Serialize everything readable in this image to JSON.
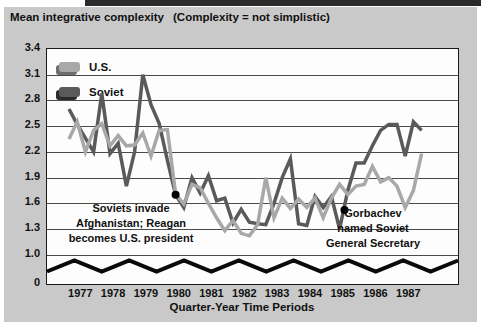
{
  "figure": {
    "title": "Mean integrative complexity",
    "subtitle": "(Complexity = not simplistic)"
  },
  "legend": [
    {
      "label": "U.S.",
      "color": "#a8a8a8",
      "shadow": "#6e6e6e"
    },
    {
      "label": "Soviet",
      "color": "#5a5a5a",
      "shadow": "#2a2a2a"
    }
  ],
  "events": [
    {
      "lines": [
        "Soviets invade",
        "Afghanistan; Reagan",
        "becomes U.S. president"
      ],
      "marker": {
        "series": "Soviet",
        "period": "1980 Q2",
        "value": 1.7,
        "index": 13
      }
    },
    {
      "lines": [
        "Gorbachev",
        "named Soviet",
        "General Secretary"
      ],
      "marker": {
        "series": "Soviet",
        "period": "1985 Q2-Q3",
        "value": 1.52,
        "index": 33.6
      }
    }
  ],
  "chart_data": {
    "type": "line",
    "title": "Mean integrative complexity",
    "xlabel": "Quarter-Year Time Periods",
    "ylabel": "Mean integrative complexity",
    "x_years": [
      "1977",
      "1978",
      "1979",
      "1980",
      "1981",
      "1982",
      "1983",
      "1984",
      "1985",
      "1986",
      "1987"
    ],
    "points_per_year": 4,
    "yticks": [
      "3.4",
      "3.1",
      "2.8",
      "2.5",
      "2.2",
      "1.9",
      "1.6",
      "1.3",
      "1.0",
      "0"
    ],
    "ylim_displayed": [
      1.0,
      3.4
    ],
    "axis_break_above_zero": true,
    "grid": "horizontal",
    "legend_position": "top-left-inside",
    "series": [
      {
        "name": "U.S.",
        "color": "#a8a8a8",
        "values": [
          2.35,
          2.55,
          2.2,
          2.45,
          2.53,
          2.27,
          2.39,
          2.27,
          2.28,
          2.42,
          2.15,
          2.45,
          2.46,
          1.71,
          1.59,
          1.82,
          1.78,
          1.6,
          1.43,
          1.28,
          1.4,
          1.25,
          1.22,
          1.35,
          1.9,
          1.43,
          1.66,
          1.54,
          1.65,
          1.55,
          1.66,
          1.43,
          1.66,
          1.82,
          1.7,
          1.8,
          1.82,
          2.03,
          1.85,
          1.9,
          1.8,
          1.55,
          1.75,
          2.18
        ]
      },
      {
        "name": "Soviet",
        "color": "#5a5a5a",
        "values": [
          2.7,
          2.52,
          2.36,
          2.2,
          2.88,
          2.18,
          2.3,
          1.8,
          2.2,
          3.1,
          2.75,
          2.53,
          2.1,
          1.7,
          1.55,
          1.9,
          1.72,
          1.92,
          1.63,
          1.66,
          1.37,
          1.53,
          1.38,
          1.36,
          1.35,
          1.6,
          1.9,
          2.12,
          1.36,
          1.34,
          1.68,
          1.55,
          1.68,
          1.3,
          1.75,
          2.07,
          2.07,
          2.27,
          2.45,
          2.52,
          2.52,
          2.15,
          2.55,
          2.45
        ]
      }
    ]
  }
}
